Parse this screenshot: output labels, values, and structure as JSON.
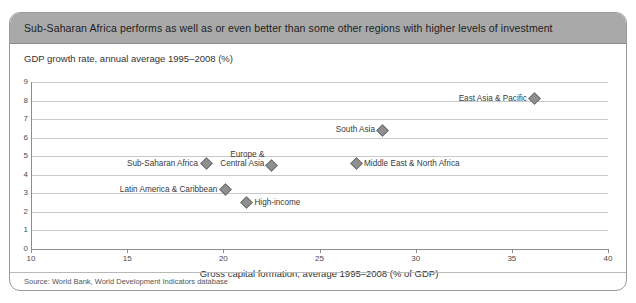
{
  "card": {
    "title": "Sub-Saharan Africa performs as well as or even better than some other regions with higher levels of investment",
    "source": "Source:  World Bank, World Development Indicators database"
  },
  "chart_data": {
    "type": "scatter",
    "title": "Sub-Saharan Africa performs as well as or even better than some other regions with higher levels of investment",
    "xlabel": "Gross capital formation, average 1995–2008 (% of GDP)",
    "ylabel": "GDP growth rate, annual average 1995–2008 (%)",
    "xlim": [
      10,
      40
    ],
    "ylim": [
      0,
      9
    ],
    "xticks": [
      10,
      15,
      20,
      25,
      30,
      35,
      40
    ],
    "yticks": [
      0,
      1,
      2,
      3,
      4,
      5,
      6,
      7,
      8,
      9
    ],
    "grid": true,
    "legend": "none",
    "marker": "diamond",
    "marker_color": "#8f8f8f",
    "points": [
      {
        "name": "East Asia & Pacific",
        "label": "East Asia & Pacific",
        "x": 36.2,
        "y": 8.1,
        "label_pos": "left"
      },
      {
        "name": "South Asia",
        "label": "South Asia",
        "x": 28.3,
        "y": 6.4,
        "label_pos": "left"
      },
      {
        "name": "Europe & Central Asia",
        "label": "Europe &\nCentral Asia",
        "label_line1": "Europe &",
        "label_line2": "Central Asia",
        "x": 22.5,
        "y": 4.5,
        "label_pos": "left-2line"
      },
      {
        "name": "Middle East & North Africa",
        "label": "Middle East & North Africa",
        "x": 26.9,
        "y": 4.6,
        "label_pos": "right"
      },
      {
        "name": "Sub-Saharan Africa",
        "label": "Sub-Saharan Africa",
        "x": 19.1,
        "y": 4.6,
        "label_pos": "left"
      },
      {
        "name": "Latin America & Caribbean",
        "label": "Latin America & Caribbean",
        "x": 20.1,
        "y": 3.2,
        "label_pos": "left"
      },
      {
        "name": "High-income",
        "label": "High-income",
        "x": 21.2,
        "y": 2.5,
        "label_pos": "right"
      }
    ]
  }
}
